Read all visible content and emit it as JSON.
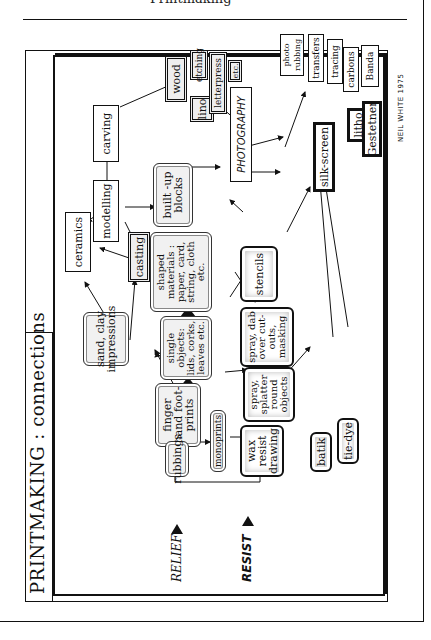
{
  "page": {
    "top_cut_text": "Printmaking",
    "signature": "NEIL WHITE  1975"
  },
  "diagram": {
    "title": "PRINTMAKING : connections",
    "section_labels": {
      "relief": "RELIEF",
      "resist": "RESIST"
    },
    "nodes": {
      "sand_clay": "sand, clay impressions",
      "ceramics": "ceramics",
      "casting": "casting",
      "modelling": "modelling",
      "carving": "carving",
      "wood": "wood",
      "lino": "lino",
      "etching": "etching",
      "letterpress": "letterpress",
      "etc": "etc.",
      "photography": "PHOTOGRAPHY",
      "photo_rubbing": "photo rubbing",
      "transfers": "transfers",
      "tracing": "tracing",
      "carbons": "carbons",
      "banda": "Banda",
      "litho": "litho",
      "gestetner": "Gestetner",
      "silkscreen": "silk-screen",
      "built_up_blocks": "built -up blocks",
      "shaped_materials": "shaped materials : paper, card, string, cloth etc.",
      "single_objects": "single objects: lids, corks, leaves etc.",
      "finger_prints": "finger hand foot- prints",
      "rubbings": "rubbings",
      "monoprints": "monoprints",
      "stencils": "stencils",
      "spray_dab": "spray, dab over cut-outs, masking",
      "spray_splatter": "spray, splatter round objects",
      "wax_resist": "wax resist drawing",
      "batik": "batik",
      "tie_dye": "tie-dye"
    }
  }
}
